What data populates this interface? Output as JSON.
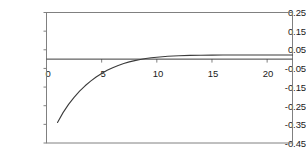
{
  "chart_data": {
    "type": "line",
    "title": "",
    "subtitle": "",
    "xlabel": "",
    "ylabel": "",
    "xlim": [
      0,
      22.3
    ],
    "ylim": [
      -0.45,
      0.25
    ],
    "grid": false,
    "legend": null,
    "annotations": [],
    "x_ticks": [
      0,
      5,
      10,
      15,
      20
    ],
    "x_tick_labels": [
      "0",
      "5",
      "10",
      "15",
      "20"
    ],
    "y_ticks": [
      0.25,
      0.15,
      0.05,
      -0.05,
      -0.15,
      -0.25,
      -0.35,
      -0.45
    ],
    "y_tick_labels": [
      "0.25",
      "0.15",
      "0.05",
      "-0.05",
      "-0.15",
      "-0.25",
      "-0.35",
      "-0.45"
    ],
    "series": [
      {
        "name": "curve",
        "color": "#3b3b3b",
        "x": [
          1,
          1.5,
          2,
          2.5,
          3,
          3.5,
          4,
          4.5,
          5,
          5.5,
          6,
          6.5,
          7,
          7.5,
          8,
          8.5,
          9,
          9.5,
          10,
          11,
          12,
          13,
          14,
          15,
          16,
          17,
          18,
          19,
          20,
          21,
          22.3
        ],
        "y": [
          -0.34,
          -0.287,
          -0.243,
          -0.205,
          -0.172,
          -0.143,
          -0.118,
          -0.096,
          -0.077,
          -0.06,
          -0.046,
          -0.034,
          -0.024,
          -0.015,
          -0.008,
          -0.002,
          0.003,
          0.007,
          0.01,
          0.015,
          0.018,
          0.02,
          0.021,
          0.0215,
          0.022,
          0.022,
          0.0222,
          0.0222,
          0.0223,
          0.0223,
          0.0223
        ]
      },
      {
        "name": "zero-line",
        "color": "#3b3b3b",
        "x": [
          0,
          22.3
        ],
        "y": [
          0,
          0
        ]
      }
    ],
    "colors": {
      "frame": "#808080",
      "axis": "#808080",
      "curve": "#3b3b3b",
      "text": "#1a1a1a",
      "background": "#ffffff"
    }
  }
}
